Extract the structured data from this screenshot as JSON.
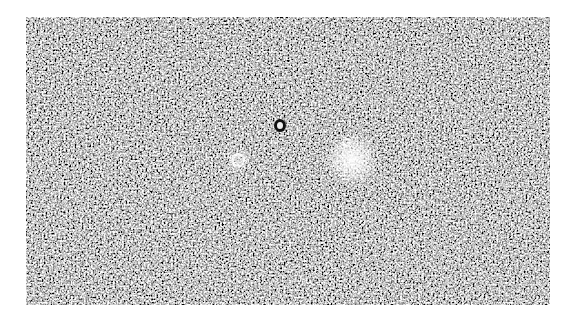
{
  "image": {
    "kind": "grainy grayscale photographic plate",
    "frame": {
      "left": 26,
      "top": 17,
      "width": 524,
      "height": 288,
      "border_color": "#ffffff"
    },
    "colors": {
      "base": "#6e6e6e",
      "light_grain": "#e8e8e8",
      "dark_grain": "#1a1a1a"
    },
    "features": [
      {
        "name": "bright-diffuse-spot",
        "x": 326,
        "y": 143,
        "radius": 28
      },
      {
        "name": "ringed-spot",
        "x": 212,
        "y": 143,
        "radius": 10
      },
      {
        "name": "dark-ring-spot",
        "x": 254,
        "y": 108,
        "radius": 7
      },
      {
        "name": "small-ring-spot",
        "x": 320,
        "y": 125,
        "radius": 5
      }
    ]
  }
}
